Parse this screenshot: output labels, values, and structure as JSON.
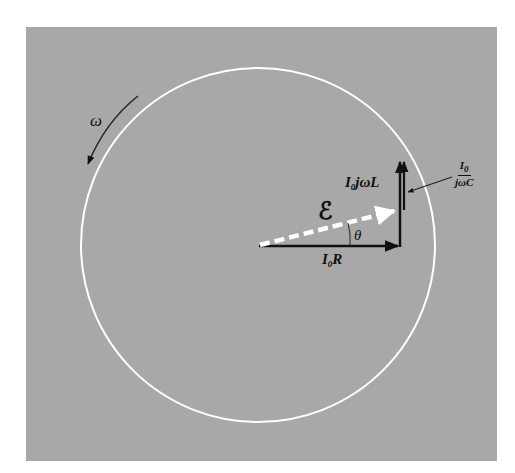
{
  "figure": {
    "background": "#a8a8a8",
    "circle": {
      "cx": 258,
      "cy": 245,
      "r": 177,
      "color": "#ffffff"
    },
    "labels": {
      "omega": "ω",
      "emf": "ℰ",
      "theta": "θ",
      "resistor_phasor": {
        "main": "I",
        "sub": "0",
        "rest": "R"
      },
      "inductor_phasor": {
        "main": "I",
        "sub": "0",
        "rest": "jωL"
      },
      "capacitor_phasor": {
        "num_main": "I",
        "num_sub": "0",
        "den": "jωC"
      }
    },
    "phasors": [
      {
        "name": "I0R",
        "from": [
          259,
          246
        ],
        "to": [
          398,
          246
        ],
        "style": "solid-black"
      },
      {
        "name": "I0jωL",
        "from": [
          400,
          246
        ],
        "to": [
          400,
          160
        ],
        "style": "solid-black"
      },
      {
        "name": "I0/jωC",
        "from": [
          404,
          160
        ],
        "to": [
          404,
          210
        ],
        "style": "solid-black"
      },
      {
        "name": "EMF",
        "from": [
          259,
          246
        ],
        "to": [
          398,
          210
        ],
        "style": "dashed-white"
      }
    ],
    "rotation_direction": "counterclockwise"
  }
}
